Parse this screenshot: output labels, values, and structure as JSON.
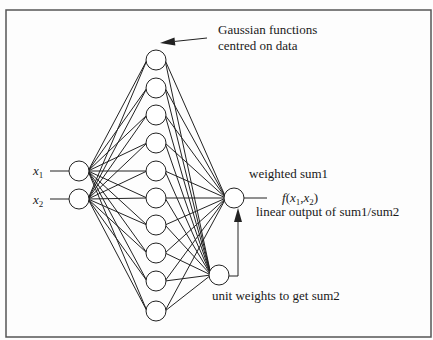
{
  "diagram": {
    "type": "rbf-network",
    "frame": {
      "x": 6,
      "y": 10,
      "width": 425,
      "height": 327,
      "stroke": "#555555"
    },
    "colors": {
      "line": "#222222",
      "node_fill": "#ffffff",
      "text": "#1a1a1a"
    },
    "node_radius": 10,
    "inputs": [
      {
        "id": "x1",
        "label": "x",
        "subscript": "1",
        "cx": 79,
        "cy": 171,
        "line_from_x": 50,
        "label_x": 33,
        "label_y": 175
      },
      {
        "id": "x2",
        "label": "x",
        "subscript": "2",
        "cx": 79,
        "cy": 199,
        "line_from_x": 50,
        "label_x": 33,
        "label_y": 204
      }
    ],
    "hidden": {
      "cx": 156,
      "cy": [
        60,
        88,
        115,
        143,
        171,
        198,
        225,
        253,
        281,
        311
      ],
      "description": "Gaussian functions centred on data"
    },
    "output": {
      "id": "sum1",
      "cx": 234,
      "cy": 198,
      "line_to_x": 267
    },
    "sum2": {
      "id": "sum2",
      "cx": 219,
      "cy": 275
    },
    "feedback_arrow": {
      "from_x": 229,
      "y": 276,
      "x": 238,
      "tip_y": 208
    },
    "gaussian_arrow": {
      "x1": 207,
      "y1": 38,
      "x2": 160,
      "y2": 43
    }
  },
  "labels": {
    "gaussian_line1": "Gaussian functions",
    "gaussian_line2": "centred on data",
    "weighted_sum": "weighted sum1",
    "output_fn_f": "f",
    "output_fn_open": "(",
    "output_fn_x": "x",
    "output_fn_sub1": "1",
    "output_fn_comma": ",",
    "output_fn_x2": "x",
    "output_fn_sub2": "2",
    "output_fn_close": ")",
    "linear_output": "linear output of sum1/sum2",
    "unit_weights": "unit weights to get sum2",
    "input1_var": "x",
    "input1_sub": "1",
    "input2_var": "x",
    "input2_sub": "2"
  }
}
